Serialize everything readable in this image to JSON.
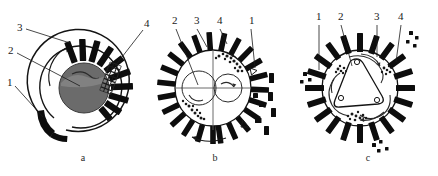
{
  "figure": {
    "title": "",
    "panels": [
      {
        "id": "a",
        "caption": "a",
        "callouts": [
          {
            "num": "3",
            "x": 17,
            "y": 31
          },
          {
            "num": "2",
            "x": 8,
            "y": 54
          },
          {
            "num": "1",
            "x": 7,
            "y": 86
          },
          {
            "num": "4",
            "x": 144,
            "y": 27
          }
        ]
      },
      {
        "id": "b",
        "caption": "b",
        "callouts": [
          {
            "num": "2",
            "x": 172,
            "y": 24
          },
          {
            "num": "3",
            "x": 194,
            "y": 24
          },
          {
            "num": "4",
            "x": 217,
            "y": 24
          },
          {
            "num": "1",
            "x": 249,
            "y": 24
          }
        ]
      },
      {
        "id": "c",
        "caption": "c",
        "callouts": [
          {
            "num": "1",
            "x": 316,
            "y": 20
          },
          {
            "num": "2",
            "x": 339,
            "y": 20
          },
          {
            "num": "3",
            "x": 374,
            "y": 20
          },
          {
            "num": "4",
            "x": 398,
            "y": 20
          }
        ]
      }
    ]
  },
  "colors": {
    "ink": "#141414",
    "tooth_fill": "#0d0d0d",
    "rotor_fill": "#6b6b6b",
    "background": "#ffffff",
    "granule": "#1a1a1a"
  },
  "captions": {
    "a": "a",
    "b": "b",
    "c": "c"
  }
}
